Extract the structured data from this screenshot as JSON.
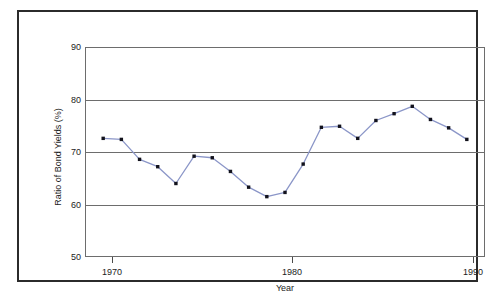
{
  "chart_data": {
    "type": "line",
    "title": "",
    "xlabel": "Year",
    "ylabel": "Ratio of Bond Yields (%)",
    "xlim": [
      1969,
      1991
    ],
    "ylim": [
      50,
      90
    ],
    "xticks": [
      1970,
      1980,
      1990
    ],
    "xtick_labels": [
      "1970",
      "1980",
      "1990"
    ],
    "yticks": [
      50,
      60,
      70,
      80,
      90
    ],
    "ytick_labels": [
      "50",
      "60",
      "70",
      "80",
      "90"
    ],
    "gridlines_y": [
      60,
      70,
      80
    ],
    "grid": true,
    "legend": "none",
    "marker": "square",
    "marker_color": "#12121c",
    "line_color": "#8b96c8",
    "x": [
      1970,
      1971,
      1972,
      1973,
      1974,
      1975,
      1976,
      1977,
      1978,
      1979,
      1980,
      1981,
      1982,
      1983,
      1984,
      1985,
      1986,
      1987,
      1988,
      1989,
      1990
    ],
    "values": [
      72.6,
      72.4,
      68.6,
      67.2,
      64.0,
      69.2,
      68.9,
      66.3,
      63.3,
      61.5,
      62.3,
      67.7,
      74.7,
      74.9,
      72.6,
      76.0,
      77.3,
      78.7,
      76.2,
      74.6,
      72.4
    ],
    "series": [
      {
        "name": "Ratio of Bond Yields",
        "values": [
          72.6,
          72.4,
          68.6,
          67.2,
          64.0,
          69.2,
          68.9,
          66.3,
          63.3,
          61.5,
          62.3,
          67.7,
          74.7,
          74.9,
          72.6,
          76.0,
          77.3,
          78.7,
          76.2,
          74.6,
          72.4
        ]
      }
    ]
  },
  "colors": {
    "line": "#8b96c8",
    "marker": "#12121c",
    "grid": "#6d6d6d",
    "frame": "#2b2b2b",
    "background": "#ffffff"
  }
}
